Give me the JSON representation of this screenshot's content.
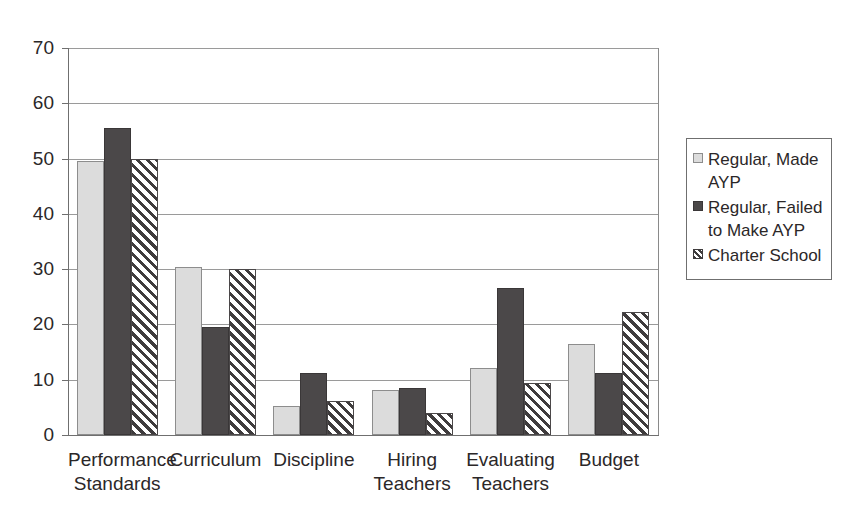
{
  "chart_data": {
    "type": "bar",
    "title": "",
    "subtitle": "",
    "xlabel": "",
    "ylabel": "",
    "ylim": [
      0,
      70
    ],
    "yticks": [
      0,
      10,
      20,
      30,
      40,
      50,
      60,
      70
    ],
    "ytick_labels": [
      "0",
      "10",
      "20",
      "30",
      "40",
      "50",
      "60",
      "70"
    ],
    "grid": "horizontal",
    "legend_position": "right",
    "categories": [
      "Performance Standards",
      "Curriculum",
      "Discipline",
      "Hiring Teachers",
      "Evaluating Teachers",
      "Budget"
    ],
    "category_lines": [
      [
        "Performance",
        "Standards"
      ],
      [
        "Curriculum"
      ],
      [
        "Discipline"
      ],
      [
        "Hiring",
        "Teachers"
      ],
      [
        "Evaluating",
        "Teachers"
      ],
      [
        "Budget"
      ]
    ],
    "series": [
      {
        "name": "Regular, Made AYP",
        "fill": "light-gray",
        "color": "#dcdcdc",
        "values": [
          49.5,
          30.3,
          5.2,
          8.2,
          12.2,
          16.4
        ]
      },
      {
        "name": "Regular, Failed to Make AYP",
        "fill": "dark-gray",
        "color": "#4b4849",
        "values": [
          55.5,
          19.6,
          11.3,
          8.5,
          26.6,
          11.3
        ]
      },
      {
        "name": "Charter School",
        "fill": "diagonal-hatch",
        "color": "#3f3c3d",
        "values": [
          50.0,
          30.1,
          6.2,
          4.0,
          9.4,
          22.2
        ]
      }
    ]
  },
  "legend": {
    "entries": [
      {
        "label_lines": [
          "Regular, Made",
          "AYP"
        ],
        "swatch": "light-gray-swatch"
      },
      {
        "label_lines": [
          "Regular, Failed",
          "to Make AYP"
        ],
        "swatch": "dark-gray-swatch"
      },
      {
        "label_lines": [
          "Charter School"
        ],
        "swatch": "hatched-swatch"
      }
    ]
  },
  "axis": {
    "y_ticks_text": [
      "70",
      "60",
      "50",
      "40",
      "30",
      "20",
      "10",
      "0"
    ]
  }
}
